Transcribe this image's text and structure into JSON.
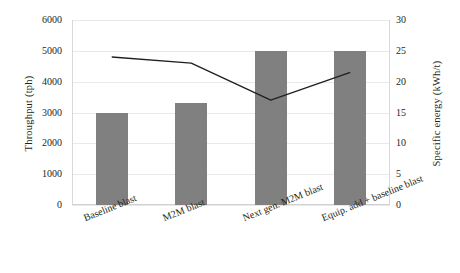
{
  "chart_data": {
    "type": "bar",
    "title": "",
    "subtitle": "",
    "xlabel": "",
    "categories": [
      "Baseline blast",
      "M2M blast",
      "Next gen. M2M blast",
      "Equip. add + baseline blast"
    ],
    "grid": true,
    "legend": "none",
    "series": [
      {
        "name": "Throughput (tph)",
        "type": "bar",
        "axis": "left",
        "color": "#808080",
        "values": [
          3000,
          3300,
          5000,
          5000
        ]
      },
      {
        "name": "Specific energy (kWh/t)",
        "type": "line",
        "axis": "right",
        "color": "#231f20",
        "values": [
          24.0,
          23.0,
          17.0,
          21.5
        ]
      }
    ],
    "axes": {
      "left": {
        "label": "Throughput (tph)",
        "ylim": [
          0,
          6000
        ],
        "ticks": [
          "0",
          "1000",
          "2000",
          "3000",
          "4000",
          "5000",
          "6000"
        ],
        "tickvalues": [
          0,
          1000,
          2000,
          3000,
          4000,
          5000,
          6000
        ]
      },
      "right": {
        "label": "Specific energy (kWh/t)",
        "ylim": [
          0,
          30
        ],
        "ticks": [
          "0",
          "5",
          "10",
          "15",
          "20",
          "25",
          "30"
        ],
        "tickvalues": [
          0,
          5,
          10,
          15,
          20,
          25,
          30
        ]
      }
    }
  }
}
